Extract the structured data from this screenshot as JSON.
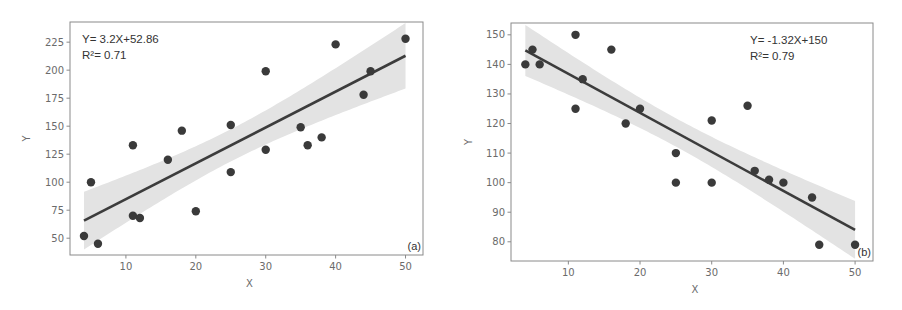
{
  "chart_data": [
    {
      "type": "scatter",
      "panel_label": "(a)",
      "title": "",
      "xlabel": "X",
      "ylabel": "Y",
      "xlim": [
        2,
        52.5
      ],
      "ylim": [
        35,
        243
      ],
      "xticks": [
        10,
        20,
        30,
        40,
        50
      ],
      "yticks": [
        50,
        75,
        100,
        125,
        150,
        175,
        200,
        225
      ],
      "grid": false,
      "annotation": {
        "equation": "Y= 3.2X+52.86",
        "r2": "R²= 0.71",
        "position": "top-left"
      },
      "regression": {
        "slope": 3.2,
        "intercept": 52.86,
        "x_range": [
          4,
          50
        ],
        "ci_band": true
      },
      "points": [
        {
          "x": 4,
          "y": 52
        },
        {
          "x": 5,
          "y": 100
        },
        {
          "x": 6,
          "y": 45
        },
        {
          "x": 11,
          "y": 133
        },
        {
          "x": 11,
          "y": 70
        },
        {
          "x": 12,
          "y": 68
        },
        {
          "x": 16,
          "y": 120
        },
        {
          "x": 18,
          "y": 146
        },
        {
          "x": 20,
          "y": 74
        },
        {
          "x": 25,
          "y": 151
        },
        {
          "x": 25,
          "y": 109
        },
        {
          "x": 30,
          "y": 199
        },
        {
          "x": 30,
          "y": 129
        },
        {
          "x": 35,
          "y": 149
        },
        {
          "x": 36,
          "y": 133
        },
        {
          "x": 38,
          "y": 140
        },
        {
          "x": 40,
          "y": 223
        },
        {
          "x": 44,
          "y": 178
        },
        {
          "x": 45,
          "y": 199
        },
        {
          "x": 50,
          "y": 228
        }
      ]
    },
    {
      "type": "scatter",
      "panel_label": "(b)",
      "title": "",
      "xlabel": "X",
      "ylabel": "Y",
      "xlim": [
        2,
        52.5
      ],
      "ylim": [
        73.5,
        154
      ],
      "xticks": [
        10,
        20,
        30,
        40,
        50
      ],
      "yticks": [
        80,
        90,
        100,
        110,
        120,
        130,
        140,
        150
      ],
      "grid": false,
      "annotation": {
        "equation": "Y= -1.32X+150",
        "r2": "R²= 0.79",
        "position": "top-right"
      },
      "regression": {
        "slope": -1.32,
        "intercept": 150,
        "x_range": [
          4,
          50
        ],
        "ci_band": true
      },
      "points": [
        {
          "x": 4,
          "y": 140
        },
        {
          "x": 5,
          "y": 145
        },
        {
          "x": 6,
          "y": 140
        },
        {
          "x": 11,
          "y": 150
        },
        {
          "x": 11,
          "y": 125
        },
        {
          "x": 12,
          "y": 135
        },
        {
          "x": 16,
          "y": 145
        },
        {
          "x": 18,
          "y": 120
        },
        {
          "x": 20,
          "y": 125
        },
        {
          "x": 25,
          "y": 110
        },
        {
          "x": 25,
          "y": 100
        },
        {
          "x": 30,
          "y": 121
        },
        {
          "x": 30,
          "y": 100
        },
        {
          "x": 35,
          "y": 126
        },
        {
          "x": 36,
          "y": 104
        },
        {
          "x": 38,
          "y": 101
        },
        {
          "x": 40,
          "y": 100
        },
        {
          "x": 44,
          "y": 95
        },
        {
          "x": 45,
          "y": 79
        },
        {
          "x": 50,
          "y": 79
        }
      ]
    }
  ],
  "style": {
    "point_color": "#3a3a3a",
    "line_color": "#3c3c3c",
    "band_color": "#e3e3e3",
    "axis_color": "#8a8a8a"
  },
  "layout": [
    {
      "svg_left": 0,
      "box": [
        70,
        22,
        423,
        255
      ]
    },
    {
      "svg_left": 450,
      "box": [
        61,
        23,
        423,
        261
      ]
    }
  ]
}
